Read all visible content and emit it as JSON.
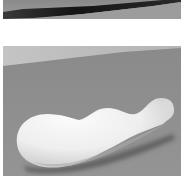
{
  "panels": [
    {
      "id": "top",
      "description": "cropped rendered surface with dark diagonal edge",
      "colors": {
        "background_light": "#9a9a9a",
        "edge_dark": "#1e1e1e",
        "floor": "#8c8c8c"
      }
    },
    {
      "id": "bottom",
      "description": "white elongated bulbous object resting on gray surface",
      "colors": {
        "backdrop": "#bdbdbd",
        "floor": "#8f8f8f",
        "object_light": "#f4f4f4",
        "object_shade": "#bcbcbc",
        "shadow": "#3a3a3a"
      }
    }
  ]
}
